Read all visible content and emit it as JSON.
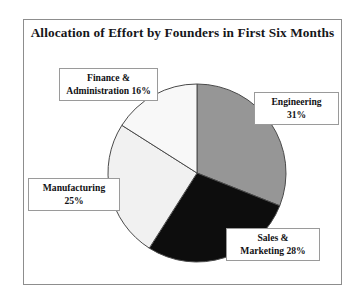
{
  "chart_data": {
    "type": "pie",
    "title": "Allocation of Effort by Founders in First Six Months",
    "xlabel": "",
    "ylabel": "",
    "legend_position": "none",
    "grid": false,
    "start_angle_deg": 0,
    "direction": "clockwise",
    "categories": [
      "Engineering",
      "Sales & Marketing",
      "Manufacturing",
      "Finance & Administration"
    ],
    "values": [
      31,
      28,
      25,
      16
    ],
    "units": "percent",
    "slices": [
      {
        "name": "Engineering",
        "value": 31,
        "label_line1": "Engineering",
        "label_line2": "31%",
        "color": "#969696"
      },
      {
        "name": "Sales & Marketing",
        "value": 28,
        "label_line1": "Sales &",
        "label_line2": "Marketing 28%",
        "color": "#0d0d0d"
      },
      {
        "name": "Manufacturing",
        "value": 25,
        "label_line1": "Manufacturing",
        "label_line2": "25%",
        "color": "#f1f1f1"
      },
      {
        "name": "Finance & Administration",
        "value": 16,
        "label_line1": "Finance &",
        "label_line2": "Administration 16%",
        "color": "#f8f8f8"
      }
    ]
  },
  "figure": {
    "frame_color": "#8d8d8d",
    "background": "#ffffff",
    "slice_outline_color": "#4a4a4a",
    "label_border_color": "#9a9a9a"
  }
}
